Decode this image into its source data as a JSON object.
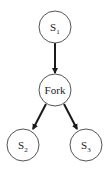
{
  "diagram": {
    "type": "tree",
    "nodes": [
      {
        "id": "S1",
        "base": "S",
        "sub": "1",
        "label": "S1",
        "cx": 55,
        "cy": 27
      },
      {
        "id": "Fork",
        "base": "Fork",
        "sub": "",
        "label": "Fork",
        "cx": 55,
        "cy": 90
      },
      {
        "id": "S2",
        "base": "S",
        "sub": "2",
        "label": "S2",
        "cx": 23,
        "cy": 145
      },
      {
        "id": "S3",
        "base": "S",
        "sub": "3",
        "label": "S3",
        "cx": 86,
        "cy": 145
      }
    ],
    "edges": [
      {
        "from": "S1",
        "to": "Fork"
      },
      {
        "from": "Fork",
        "to": "S2"
      },
      {
        "from": "Fork",
        "to": "S3"
      }
    ],
    "colors": {
      "node_stroke": "#555555",
      "edge": "#1a1a1a",
      "text": "#222222"
    }
  }
}
